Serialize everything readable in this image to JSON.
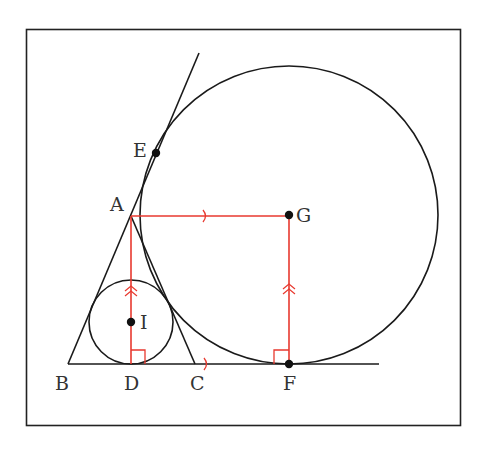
{
  "diagram": {
    "colors": {
      "stroke": "#1a1a1a",
      "highlight": "#e8392f",
      "frame": "#222222"
    },
    "labels": {
      "A": "A",
      "B": "B",
      "C": "C",
      "D": "D",
      "E": "E",
      "F": "F",
      "G": "G",
      "I": "I"
    },
    "points": {
      "A": [
        131,
        216
      ],
      "B": [
        68,
        364
      ],
      "C": [
        195,
        364
      ],
      "D": [
        131,
        364
      ],
      "E": [
        156,
        153
      ],
      "F": [
        289,
        364
      ],
      "G": [
        289,
        215
      ],
      "I": [
        131,
        322
      ]
    },
    "circles": {
      "incircle": {
        "center": "I",
        "radius": 42
      },
      "excircle": {
        "center": "G",
        "radius": 149
      }
    },
    "markings": {
      "parallel_single": [
        "AG",
        "DF"
      ],
      "parallel_double": [
        "AD",
        "GF"
      ],
      "right_angles": [
        "D",
        "F"
      ]
    }
  }
}
